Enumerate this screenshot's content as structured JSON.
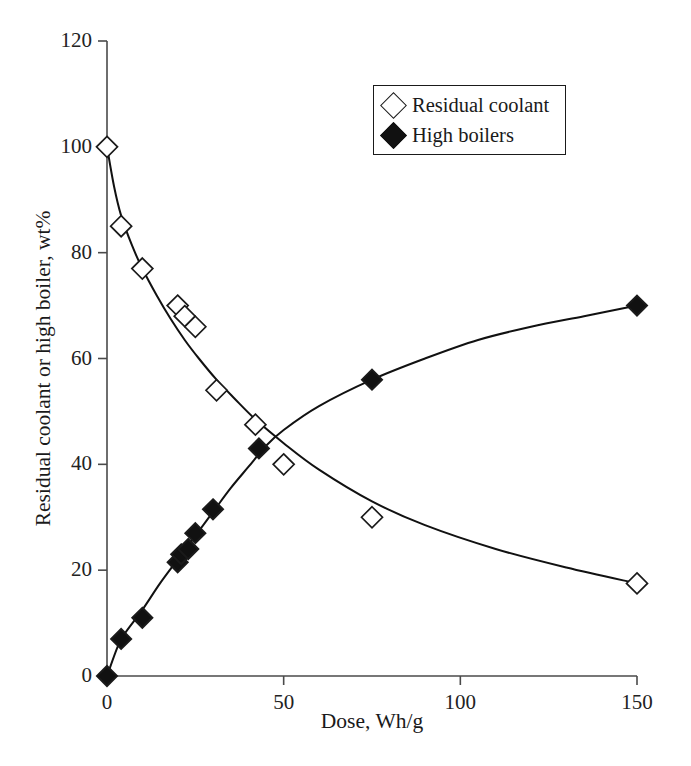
{
  "figure": {
    "background": "#ffffff",
    "ink_color": "#1a1a1a"
  },
  "axes": {
    "x_title": "Dose, Wh/g",
    "y_title": "Residual coolant or high boiler, wt%",
    "x_ticks": [
      "0",
      "50",
      "100",
      "150"
    ],
    "y_ticks": [
      "0",
      "20",
      "40",
      "60",
      "80",
      "100",
      "120"
    ]
  },
  "legend": {
    "entries": [
      {
        "label": "Residual coolant",
        "marker": "open-diamond-icon",
        "fill": "none",
        "stroke": "#1a1a1a"
      },
      {
        "label": "High boilers",
        "marker": "filled-diamond-icon",
        "fill": "#111111",
        "stroke": "#111111"
      }
    ]
  },
  "chart_data": {
    "type": "scatter",
    "title": "",
    "xlabel": "Dose, Wh/g",
    "ylabel": "Residual coolant or high boiler, wt%",
    "xlim": [
      0,
      150
    ],
    "ylim": [
      0,
      120
    ],
    "xticks": [
      0,
      50,
      100,
      150
    ],
    "yticks": [
      0,
      20,
      40,
      60,
      80,
      100,
      120
    ],
    "grid": false,
    "legend_position": "top-right-inside",
    "series": [
      {
        "name": "Residual coolant",
        "marker": "open diamond",
        "fill": "none",
        "stroke": "#1a1a1a",
        "fit_curve": true,
        "x": [
          0,
          4,
          10,
          20,
          22,
          25,
          31,
          42,
          50,
          75,
          150
        ],
        "y": [
          100,
          85,
          77,
          70,
          68,
          66,
          54,
          47.5,
          40,
          30,
          17.5
        ]
      },
      {
        "name": "High boilers",
        "marker": "filled diamond",
        "fill": "#111111",
        "stroke": "#111111",
        "fit_curve": true,
        "x": [
          0,
          4,
          10,
          20,
          21,
          23,
          25,
          30,
          43,
          75,
          150
        ],
        "y": [
          0,
          7,
          11,
          21.5,
          23,
          24,
          27,
          31.5,
          43,
          56,
          70
        ]
      }
    ],
    "fit_curves": {
      "Residual coolant": [
        [
          0,
          100
        ],
        [
          2,
          92.5
        ],
        [
          4,
          87
        ],
        [
          7,
          81.5
        ],
        [
          10,
          77
        ],
        [
          14,
          72
        ],
        [
          18,
          67.5
        ],
        [
          22,
          63.5
        ],
        [
          26,
          60
        ],
        [
          31,
          56
        ],
        [
          36,
          52.5
        ],
        [
          42,
          48.5
        ],
        [
          50,
          44
        ],
        [
          60,
          39
        ],
        [
          75,
          33
        ],
        [
          90,
          28.5
        ],
        [
          110,
          24
        ],
        [
          130,
          20.5
        ],
        [
          150,
          17.5
        ]
      ],
      "High boilers": [
        [
          0,
          0
        ],
        [
          3,
          5.5
        ],
        [
          5,
          8
        ],
        [
          10,
          12.5
        ],
        [
          15,
          17.5
        ],
        [
          20,
          22
        ],
        [
          25,
          26.5
        ],
        [
          30,
          31
        ],
        [
          35,
          35.5
        ],
        [
          40,
          39.5
        ],
        [
          45,
          43.5
        ],
        [
          50,
          46.5
        ],
        [
          60,
          51
        ],
        [
          75,
          56
        ],
        [
          90,
          60
        ],
        [
          105,
          63.5
        ],
        [
          120,
          66
        ],
        [
          135,
          68
        ],
        [
          150,
          70
        ]
      ]
    }
  }
}
